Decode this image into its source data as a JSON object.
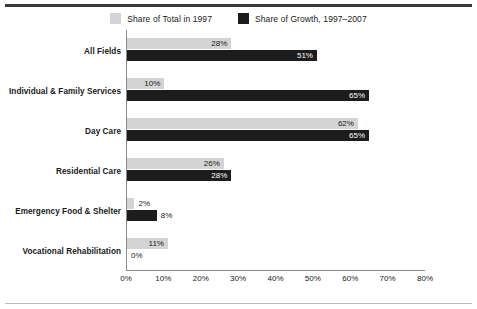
{
  "chart_data": {
    "type": "bar",
    "orientation": "horizontal",
    "title": "",
    "xlabel": "",
    "ylabel": "",
    "xlim": [
      0,
      80
    ],
    "xticks": [
      "0%",
      "10%",
      "20%",
      "30%",
      "40%",
      "50%",
      "60%",
      "70%",
      "80%"
    ],
    "xtick_values": [
      0,
      10,
      20,
      30,
      40,
      50,
      60,
      70,
      80
    ],
    "grid": false,
    "legend_position": "top-center",
    "categories": [
      "All Fields",
      "Individual & Family Services",
      "Day Care",
      "Residential Care",
      "Emergency Food & Shelter",
      "Vocational Rehabilitation"
    ],
    "series": [
      {
        "name": "Share of Total in 1997",
        "color": "#d4d4d4",
        "values": [
          28,
          10,
          62,
          26,
          2,
          11
        ],
        "labels": [
          "28%",
          "10%",
          "62%",
          "26%",
          "2%",
          "11%"
        ]
      },
      {
        "name": "Share of Growth, 1997–2007",
        "color": "#1c1c1c",
        "values": [
          51,
          65,
          65,
          28,
          8,
          0
        ],
        "labels": [
          "51%",
          "65%",
          "65%",
          "28%",
          "8%",
          "0%"
        ]
      }
    ]
  },
  "legend": {
    "entries": [
      {
        "label": "Share of Total in 1997",
        "color": "#d4d4d4"
      },
      {
        "label": "Share of Growth, 1997–2007",
        "color": "#1c1c1c"
      }
    ]
  }
}
